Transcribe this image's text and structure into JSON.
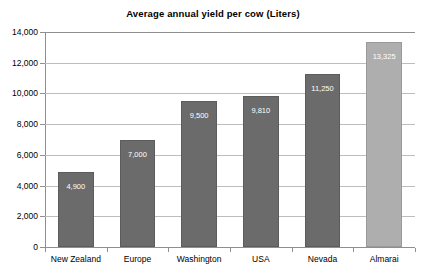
{
  "chart_data": {
    "type": "bar",
    "title": "Average annual yield per cow (Liters)",
    "xlabel": "",
    "ylabel": "",
    "categories": [
      "New Zealand",
      "Europe",
      "Washington",
      "USA",
      "Nevada",
      "Almarai"
    ],
    "values": [
      4900,
      7000,
      9500,
      9810,
      11250,
      13325
    ],
    "value_labels": [
      "4,900",
      "7,000",
      "9,500",
      "9,810",
      "11,250",
      "13,325"
    ],
    "ylim": [
      0,
      14000
    ],
    "ytick_values": [
      0,
      2000,
      4000,
      6000,
      8000,
      10000,
      12000,
      14000
    ],
    "ytick_labels": [
      "0",
      "2,000",
      "4,000",
      "6,000",
      "8,000",
      "10,000",
      "12,000",
      "14,000"
    ],
    "grid": true,
    "legend": false,
    "legend_position": "none",
    "series": [
      {
        "name": "Average annual yield per cow (Liters)",
        "values": [
          4900,
          7000,
          9500,
          9810,
          11250,
          13325
        ]
      }
    ],
    "colors": {
      "bar_default": "#6b6b6b",
      "bar_highlight": "#aeaeae",
      "bar_border": "#5c5c5c",
      "gridline": "#bdbdbd",
      "axis": "#8f8f8f",
      "value_label": "#ffffff",
      "background": "#ffffff",
      "text": "#000000"
    },
    "highlight_category": "Almarai"
  }
}
